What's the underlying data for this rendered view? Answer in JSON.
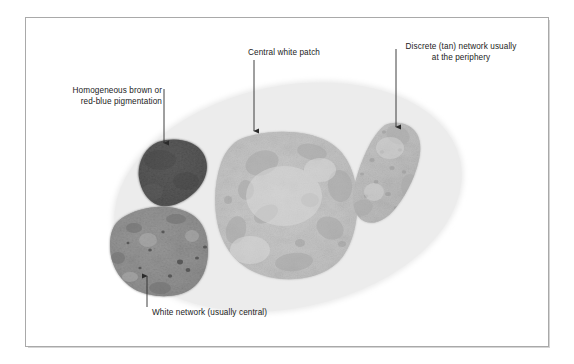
{
  "figure": {
    "background_color": "#ffffff",
    "frame_border_color": "#a9a9a9",
    "lesion_fill_color": "#ebebeb",
    "text_color": "#1b1b1b",
    "arrow_color": "#2a2a2a"
  },
  "annotations": [
    {
      "id": "homogeneous-pigmentation",
      "text": "Homogeneous brown or\nred-blue pigmentation",
      "align": "right",
      "arrow": {
        "from_x": 164,
        "from_y": 89,
        "to_x": 164,
        "to_y": 148,
        "direction": "down"
      }
    },
    {
      "id": "central-white-patch",
      "text": "Central white patch",
      "align": "left",
      "arrow": {
        "from_x": 254,
        "from_y": 60,
        "to_x": 254,
        "to_y": 136,
        "direction": "down"
      }
    },
    {
      "id": "discrete-tan-network",
      "text": "Discrete (tan) network usually\nat the periphery",
      "align": "center",
      "arrow": {
        "from_x": 396,
        "from_y": 49,
        "to_x": 396,
        "to_y": 132,
        "direction": "down"
      }
    },
    {
      "id": "white-network",
      "text": "White network (usually central)",
      "align": "left",
      "arrow": {
        "from_x": 147,
        "from_y": 307,
        "to_x": 147,
        "to_y": 271,
        "direction": "up"
      }
    }
  ],
  "lesion_structures": [
    {
      "id": "background-lesion-ellipse",
      "name": "background lesion field",
      "shape": "ellipse",
      "fill": "#ebebeb",
      "cx": 288,
      "cy": 197,
      "rx": 178,
      "ry": 113,
      "rotation_deg": -12
    },
    {
      "id": "homogeneous-brown-patch",
      "name": "Homogeneous brown or red-blue pigmentation",
      "shape": "blob",
      "fill": "#565656",
      "center_x": 171,
      "center_y": 175
    },
    {
      "id": "white-network-patch",
      "name": "White network (usually central)",
      "shape": "blob",
      "fill": "#8e8e8e",
      "center_x": 158,
      "center_y": 248
    },
    {
      "id": "central-white-patch-region",
      "name": "Central white patch",
      "shape": "blob",
      "fill": "#c4c4c4",
      "center_x": 281,
      "center_y": 205
    },
    {
      "id": "discrete-tan-network-patch",
      "name": "Discrete (tan) network usually at the periphery",
      "shape": "blob",
      "fill": "#bdbdbd",
      "center_x": 394,
      "center_y": 175
    }
  ]
}
